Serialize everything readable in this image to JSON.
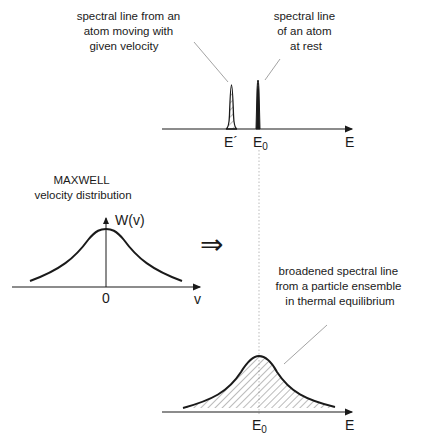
{
  "top_panel": {
    "moving_atom_label": [
      "spectral line from an",
      "atom moving with",
      "given velocity"
    ],
    "rest_atom_label": [
      "spectral line",
      "of an atom",
      "at rest"
    ],
    "tick_e_prime": "E´",
    "tick_e0_main": "E",
    "tick_e0_sub": "0",
    "axis_label": "E"
  },
  "left_panel": {
    "title_line1": "MAXWELL",
    "title_line2": "velocity distribution",
    "y_axis_label": "W(v)",
    "x_tick_zero": "0",
    "x_axis_label": "v"
  },
  "arrow": {
    "symbol": "⇒"
  },
  "bottom_panel": {
    "annotation": [
      "broadened spectral line",
      "from a particle ensemble",
      "in thermal equilibrium"
    ],
    "tick_e0_main": "E",
    "tick_e0_sub": "0",
    "axis_label": "E"
  },
  "colors": {
    "ink": "#1a1a1a",
    "leader_line": "#999999",
    "dotted_guide": "#aaaaaa",
    "hatch": "#555555"
  }
}
